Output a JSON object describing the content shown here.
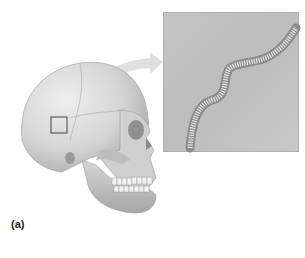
{
  "figure": {
    "panel_label": "(a)",
    "highlight_box": {
      "shape": "square",
      "region": "parietal bone / suture"
    },
    "inset": {
      "subject": "magnified serrated suture"
    },
    "arrow": {
      "from": "highlight box",
      "to": "inset"
    }
  },
  "colors": {
    "background": "#ffffff",
    "bone_light": "#e2e2e2",
    "bone_shadow": "#9a9a9a",
    "inset_bg": "#c2c2c2",
    "suture": "#8a8a8a",
    "arrow": "#dcdcdc",
    "label_text": "#222222"
  }
}
